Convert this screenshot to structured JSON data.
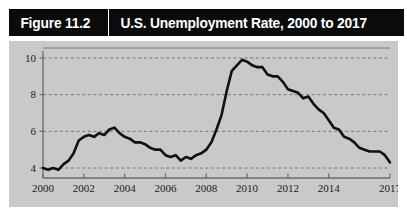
{
  "figure": {
    "number_label": "Figure 11.2",
    "title": "U.S. Unemployment Rate, 2000 to 2017"
  },
  "colors": {
    "title_bar_bg": "#0b0b0b",
    "title_text": "#ffffff",
    "panel_bg": "#c9c9c9",
    "series": "#111111",
    "grid": "#6e6e6e",
    "axis": "#6b6b6b",
    "page_bg": "#ffffff"
  },
  "chart_data": {
    "type": "line",
    "title": "U.S. Unemployment Rate, 2000 to 2017",
    "xlabel": "",
    "ylabel": "",
    "grid": true,
    "legend": false,
    "xlim": [
      2000,
      2017
    ],
    "ylim": [
      3.2,
      10.8
    ],
    "yticks": [
      4,
      6,
      8,
      10
    ],
    "ytick_labels": [
      "4",
      "6",
      "8",
      "10"
    ],
    "xticks": [
      2000,
      2002,
      2004,
      2006,
      2008,
      2010,
      2012,
      2014,
      2017
    ],
    "xtick_labels": [
      "2000",
      "2002",
      "2004",
      "2006",
      "2008",
      "2010",
      "2012",
      "2014",
      "2017"
    ],
    "series": [
      {
        "name": "U.S. unemployment rate (percent)",
        "x": [
          2000.0,
          2000.25,
          2000.5,
          2000.75,
          2001.0,
          2001.25,
          2001.5,
          2001.75,
          2002.0,
          2002.25,
          2002.5,
          2002.75,
          2003.0,
          2003.25,
          2003.5,
          2003.75,
          2004.0,
          2004.25,
          2004.5,
          2004.75,
          2005.0,
          2005.25,
          2005.5,
          2005.75,
          2006.0,
          2006.25,
          2006.5,
          2006.75,
          2007.0,
          2007.25,
          2007.5,
          2007.75,
          2008.0,
          2008.25,
          2008.5,
          2008.75,
          2009.0,
          2009.25,
          2009.5,
          2009.75,
          2010.0,
          2010.25,
          2010.5,
          2010.75,
          2011.0,
          2011.25,
          2011.5,
          2011.75,
          2012.0,
          2012.25,
          2012.5,
          2012.75,
          2013.0,
          2013.25,
          2013.5,
          2013.75,
          2014.0,
          2014.25,
          2014.5,
          2014.75,
          2015.0,
          2015.25,
          2015.5,
          2015.75,
          2016.0,
          2016.25,
          2016.5,
          2016.75,
          2017.0
        ],
        "values": [
          4.0,
          3.9,
          4.0,
          3.9,
          4.2,
          4.4,
          4.8,
          5.5,
          5.7,
          5.8,
          5.7,
          5.9,
          5.8,
          6.1,
          6.2,
          5.9,
          5.7,
          5.6,
          5.4,
          5.4,
          5.3,
          5.1,
          5.0,
          5.0,
          4.7,
          4.6,
          4.7,
          4.4,
          4.6,
          4.5,
          4.7,
          4.8,
          5.0,
          5.4,
          6.1,
          6.9,
          8.2,
          9.3,
          9.6,
          9.9,
          9.8,
          9.6,
          9.5,
          9.5,
          9.1,
          9.0,
          9.0,
          8.7,
          8.3,
          8.2,
          8.1,
          7.8,
          7.9,
          7.5,
          7.2,
          7.0,
          6.6,
          6.2,
          6.1,
          5.7,
          5.6,
          5.4,
          5.1,
          5.0,
          4.9,
          4.9,
          4.9,
          4.7,
          4.3
        ]
      }
    ]
  }
}
